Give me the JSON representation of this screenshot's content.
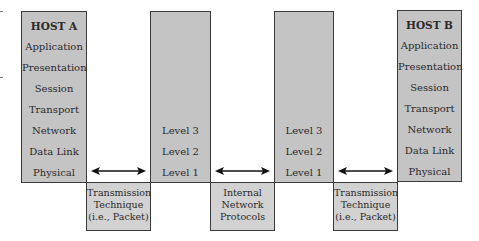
{
  "host_a": {
    "title": "HOST A",
    "layers": [
      "Application",
      "Presentation",
      "Session",
      "Transport",
      "Network",
      "Data Link",
      "Physical"
    ]
  },
  "node_1": {
    "levels": [
      "Level 3",
      "Level 2",
      "Level 1"
    ]
  },
  "node_2": {
    "levels": [
      "Level 3",
      "Level 2",
      "Level 1"
    ]
  },
  "host_b": {
    "title": "HOST B",
    "layers": [
      "Application",
      "Presentation",
      "Session",
      "Transport",
      "Network",
      "Data Link",
      "Physical"
    ]
  },
  "links": [
    {
      "lines": [
        "Transmission",
        "Technique",
        "(i.e., Packet)"
      ]
    },
    {
      "lines": [
        "Internal",
        "Network",
        "Protocols"
      ]
    },
    {
      "lines": [
        "Transmission",
        "Technique",
        "(i.e., Packet)"
      ]
    }
  ],
  "colors": {
    "column_fill": "#c4c4c4",
    "box_fill": "#d2d2d2",
    "border": "#3a3a3a"
  }
}
